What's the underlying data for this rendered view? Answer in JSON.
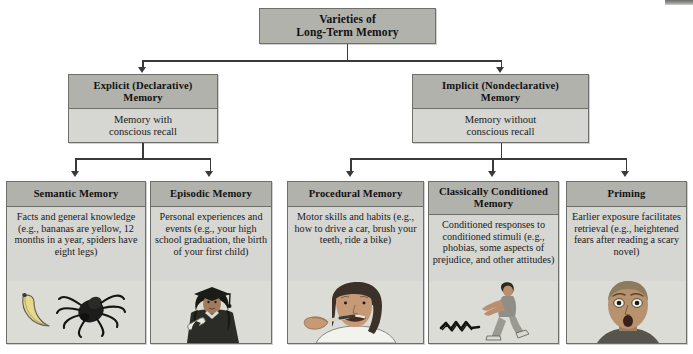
{
  "diagram": {
    "root": {
      "title_line1": "Varieties of",
      "title_line2": "Long-Term Memory"
    },
    "level2": [
      {
        "id": "explicit",
        "header_line1": "Explicit (Declarative)",
        "header_line2": "Memory",
        "body_line1": "Memory with",
        "body_line2": "conscious recall"
      },
      {
        "id": "implicit",
        "header_line1": "Implicit (Nondeclarative)",
        "header_line2": "Memory",
        "body_line1": "Memory without",
        "body_line2": "conscious recall"
      }
    ],
    "level3": [
      {
        "id": "semantic",
        "header": "Semantic Memory",
        "body": "Facts and general knowledge (e.g., bananas are yellow, 12 months in a year, spiders have eight legs)",
        "illustration": "banana-and-spider-illustration"
      },
      {
        "id": "episodic",
        "header": "Episodic Memory",
        "body": "Personal experiences and events (e.g., your high school graduation, the birth of your first child)",
        "illustration": "graduate-in-cap-and-gown-illustration"
      },
      {
        "id": "procedural",
        "header": "Procedural Memory",
        "body": "Motor skills and habits (e.g., how to drive a car, brush your teeth, ride a bike)",
        "illustration": "person-brushing-teeth-illustration"
      },
      {
        "id": "classical",
        "header_line1": "Classically Conditioned",
        "header_line2": "Memory",
        "body": "Conditioned responses to conditioned stimuli (e.g., phobias, some aspects of prejudice, and other attitudes)",
        "illustration": "person-recoiling-from-snake-illustration"
      },
      {
        "id": "priming",
        "header": "Priming",
        "body": "Earlier exposure facilitates retrieval (e.g., heightened fears after reading a scary novel)",
        "illustration": "frightened-face-illustration"
      }
    ],
    "colors": {
      "header_fill": "#b2b2ad",
      "body_fill": "#d6d6d2",
      "border": "#6e6e6a",
      "connector": "#3a3a38",
      "art_background": "#dcdcd7",
      "page_background": "#ffffff"
    }
  }
}
